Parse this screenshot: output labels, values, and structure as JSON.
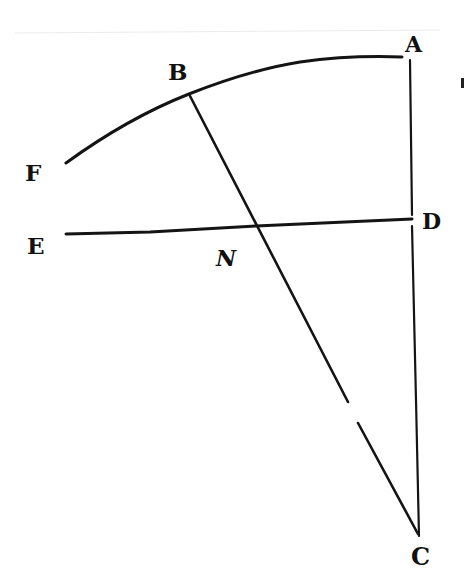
{
  "diagram": {
    "type": "geometric-figure",
    "background": "#ffffff",
    "ink_color": "#141414",
    "points": {
      "A": {
        "label": "A",
        "x": 408,
        "y": 57
      },
      "B": {
        "label": "B",
        "x": 189,
        "y": 94
      },
      "C": {
        "label": "C",
        "x": 419,
        "y": 536
      },
      "D": {
        "label": "D",
        "x": 412,
        "y": 220
      },
      "E": {
        "label": "E",
        "x": 66,
        "y": 234
      },
      "F": {
        "label": "F",
        "x": 66,
        "y": 163
      },
      "N": {
        "label": "N",
        "x": 256,
        "y": 226
      }
    },
    "elements": [
      {
        "kind": "arc",
        "through": [
          "F",
          "B",
          "A"
        ],
        "description": "curve FBA"
      },
      {
        "kind": "segment",
        "from": "A",
        "to": "C",
        "description": "vertical line AC through D"
      },
      {
        "kind": "segment",
        "from": "E",
        "to": "D",
        "description": "line ED through N"
      },
      {
        "kind": "segment",
        "from": "B",
        "to": "C",
        "description": "line BC through N (broken near lower section)"
      }
    ],
    "labels": {
      "A": "A",
      "B": "B",
      "C": "C",
      "D": "D",
      "E": "E",
      "F": "F",
      "N": "N"
    }
  }
}
